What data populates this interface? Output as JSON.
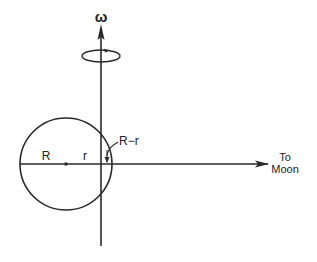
{
  "diagram": {
    "labels": {
      "omega": "ω",
      "R": "R",
      "r": "r",
      "R_minus_r": "R−r",
      "to": "To",
      "moon": "Moon"
    },
    "colors": {
      "stroke": "#2a2a2a",
      "background": "#ffffff"
    },
    "geometry": {
      "circle": {
        "cx": 66,
        "cy": 164,
        "r": 46
      },
      "rotation_axis_x": 101,
      "rotation_ellipse": {
        "cx": 101,
        "cy": 56,
        "rx": 19,
        "ry": 6
      },
      "moon_line_end_x": 268
    }
  }
}
